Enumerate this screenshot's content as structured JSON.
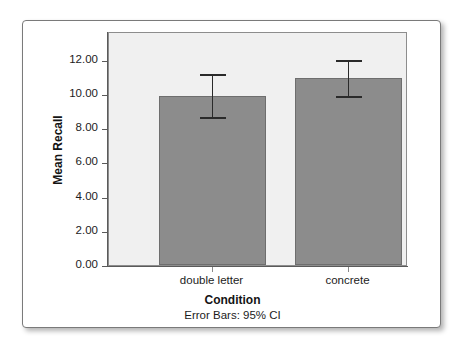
{
  "chart_data": {
    "type": "bar",
    "title": "",
    "subtitle": "",
    "xlabel": "Condition",
    "ylabel": "Mean Recall",
    "footnote": "Error Bars: 95% CI",
    "categories": [
      "double letter",
      "concrete"
    ],
    "values": [
      9.85,
      10.9
    ],
    "error_bars": {
      "type": "95% CI",
      "lower": [
        8.55,
        9.75
      ],
      "upper": [
        11.15,
        12.0
      ]
    },
    "series": [
      {
        "name": "Mean Recall",
        "values": [
          9.85,
          10.9
        ]
      }
    ],
    "ylim": [
      0.0,
      13.55
    ],
    "ytick_values": [
      0.0,
      2.0,
      4.0,
      6.0,
      8.0,
      10.0,
      12.0
    ],
    "ytick_labels": [
      "0.00",
      "2.00",
      "4.00",
      "6.00",
      "8.00",
      "10.00",
      "12.00"
    ],
    "grid": false,
    "legend": false,
    "legend_position": "none",
    "colors": {
      "bar_fill": "#8c8c8c",
      "bar_border": "#6e6e6e",
      "plot_background": "#f0f0f0",
      "figure_background": "#ffffff",
      "axis": "#5a5a5a",
      "error_bar": "#2a2a2a",
      "text": "#1c1c1c"
    }
  }
}
